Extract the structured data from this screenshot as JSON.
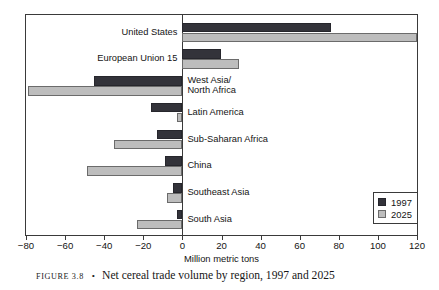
{
  "caption": {
    "figure_number": "FIGURE 3.8",
    "separator": "•",
    "text": "Net cereal trade volume by region, 1997 and 2025"
  },
  "legend": {
    "position": "inside-right-lower",
    "entries": [
      {
        "label": "1997",
        "color": "#33333a",
        "swatch_name": "legend-swatch-1997"
      },
      {
        "label": "2025",
        "color": "#bdbdbd",
        "swatch_name": "legend-swatch-2025"
      }
    ]
  },
  "axis": {
    "title": "Million metric tons",
    "ticks": [
      "−80",
      "−60",
      "−40",
      "−20",
      "0",
      "20",
      "40",
      "60",
      "80",
      "100",
      "120"
    ],
    "tick_values": [
      -80,
      -60,
      -40,
      -20,
      0,
      20,
      40,
      60,
      80,
      100,
      120
    ]
  },
  "chart_data": {
    "type": "bar",
    "orientation": "horizontal",
    "title": "Net cereal trade volume by region, 1997 and 2025",
    "xlabel": "Million metric tons",
    "ylabel": "",
    "xlim": [
      -80,
      120
    ],
    "xticks": [
      -80,
      -60,
      -40,
      -20,
      0,
      20,
      40,
      60,
      80,
      100,
      120
    ],
    "grid": false,
    "legend_position": "inside-right-lower",
    "categories": [
      "United States",
      "European Union 15",
      "West Asia/\nNorth Africa",
      "Latin America",
      "Sub-Saharan Africa",
      "China",
      "Southeast Asia",
      "South Asia"
    ],
    "series": [
      {
        "name": "1997",
        "color": "#33333a",
        "values": [
          76,
          20,
          -45,
          -16,
          -13,
          -9,
          -5,
          -3
        ]
      },
      {
        "name": "2025",
        "color": "#bdbdbd",
        "values": [
          120,
          29,
          -79,
          -3,
          -35,
          -49,
          -8,
          -23
        ]
      }
    ]
  }
}
